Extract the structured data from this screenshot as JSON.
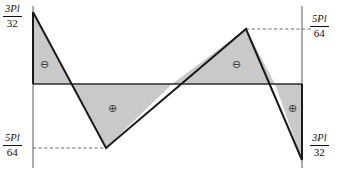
{
  "diagram": {
    "kind": "shear-force-diagram",
    "colors": {
      "fill": "#c9c9c9",
      "stroke": "#1a1a1a",
      "axis": "#555555",
      "dashed": "#555555",
      "background": "#ffffff",
      "text": "#111111"
    },
    "geometry": {
      "left_axis_x": 33,
      "right_axis_x": 302,
      "baseline_y": 84,
      "axis_top_y": 6,
      "axis_bottom_y": 168,
      "points": {
        "start_top": [
          33,
          12
        ],
        "zero_1": [
          72,
          84
        ],
        "bottom_peak": [
          106,
          148
        ],
        "zero_2": [
          172,
          84
        ],
        "top_peak": [
          246,
          29
        ],
        "zero_3": [
          275,
          84
        ],
        "end_bottom": [
          302,
          160
        ]
      },
      "dashed_lines": [
        {
          "name": "bottom-left-dashed",
          "x1": 33,
          "y1": 148,
          "x2": 106,
          "y2": 148
        },
        {
          "name": "top-right-dashed",
          "x1": 246,
          "y1": 29,
          "x2": 310,
          "y2": 29
        }
      ]
    },
    "labels": {
      "top_left": {
        "numerator": "3Pl",
        "denominator": "32",
        "text": "3Pl/32"
      },
      "bottom_left": {
        "numerator": "5Pl",
        "denominator": "64",
        "text": "5Pl/64"
      },
      "top_right": {
        "numerator": "5Pl",
        "denominator": "64",
        "text": "5Pl/64"
      },
      "bottom_right": {
        "numerator": "3Pl",
        "denominator": "32",
        "text": "3Pl/32"
      }
    },
    "signs": [
      {
        "name": "sign-negative-left",
        "glyph": "⊖",
        "x": 40,
        "y": 59
      },
      {
        "name": "sign-positive-left",
        "glyph": "⊕",
        "x": 108,
        "y": 103
      },
      {
        "name": "sign-negative-right",
        "glyph": "⊖",
        "x": 232,
        "y": 59
      },
      {
        "name": "sign-positive-right",
        "glyph": "⊕",
        "x": 288,
        "y": 103
      }
    ],
    "regions": [
      {
        "name": "region-negative-1",
        "sign": "negative",
        "polygon": "33,12 72,84 33,84"
      },
      {
        "name": "region-positive-1",
        "sign": "positive",
        "polygon": "72,84 106,148 172,84"
      },
      {
        "name": "region-negative-2",
        "sign": "negative",
        "polygon": "172,84 246,29 275,84"
      },
      {
        "name": "region-positive-2",
        "sign": "positive",
        "polygon": "275,84 302,160 302,84"
      }
    ]
  }
}
